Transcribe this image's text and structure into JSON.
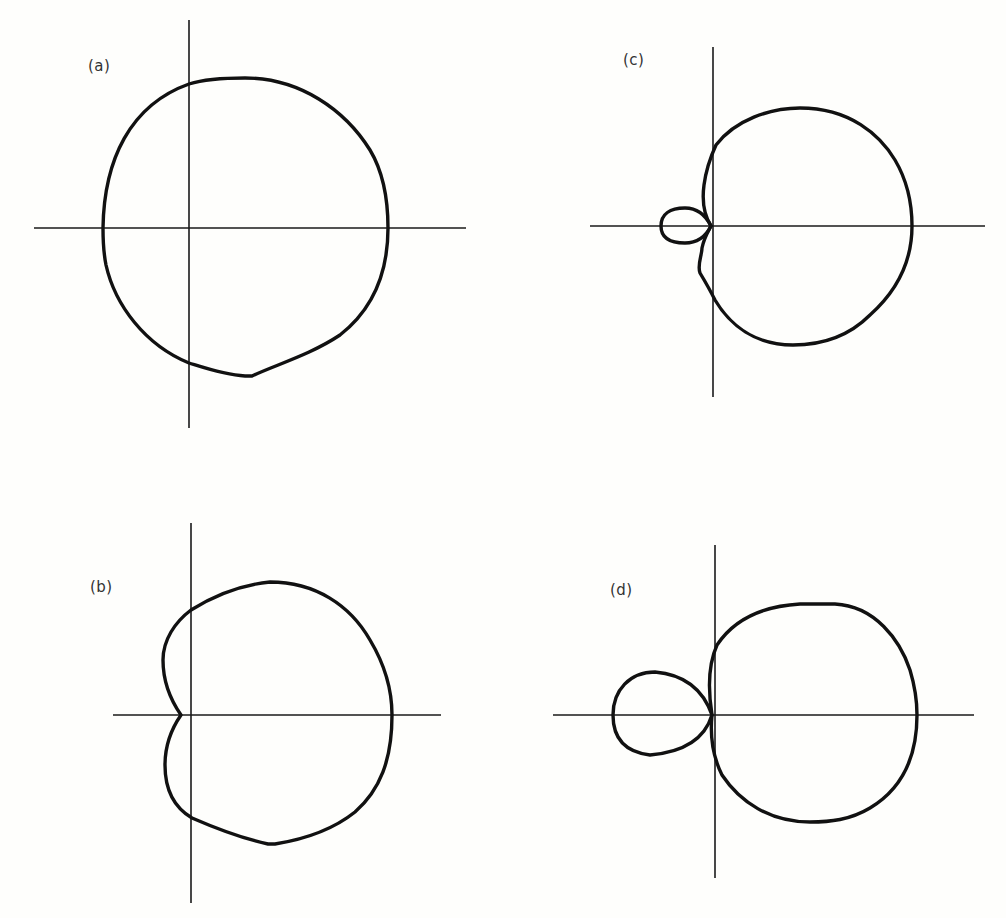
{
  "figure": {
    "panels": [
      {
        "id": "a",
        "label": "(a)",
        "label_pos": [
          88,
          60
        ]
      },
      {
        "id": "b",
        "label": "(b)",
        "label_pos": [
          90,
          581
        ]
      },
      {
        "id": "c",
        "label": "(c)",
        "label_pos": [
          623,
          54
        ]
      },
      {
        "id": "d",
        "label": "(d)",
        "label_pos": [
          610,
          584
        ]
      }
    ],
    "colors": {
      "background": "#fefefc",
      "stroke": "#111111"
    }
  }
}
